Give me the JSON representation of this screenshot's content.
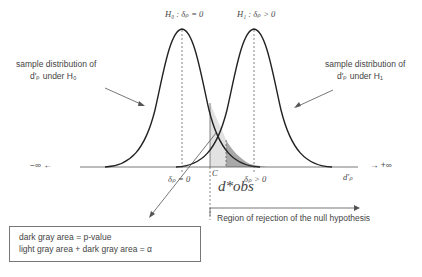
{
  "hypotheses": {
    "h0": "H₀ : δₚ = 0",
    "h1": "H₁ : δₚ > 0"
  },
  "left_label": {
    "line1": "sample distribution of",
    "line2": "d′ₚ  under  H₀"
  },
  "right_label": {
    "line1": "sample distribution of",
    "line2": "d′ₚ  under  H₁"
  },
  "axis": {
    "neg_inf": "−∞ ←",
    "pos_inf": "→ +∞",
    "variable": "d′ₚ",
    "tick_h0": "δₚ = 0",
    "tick_h1": "δₚ > 0",
    "critical": "C",
    "observed": "d*obs"
  },
  "rejection_region": "Region of rejection of  the null hypothesis",
  "legend": {
    "line1": "dark gray area =  p-value",
    "line2": "light gray area + dark gray area =  α"
  },
  "colors": {
    "curve": "#222222",
    "light_gray": "#e2e2e2",
    "dark_gray": "#a8a8a8",
    "text": "#444444"
  }
}
